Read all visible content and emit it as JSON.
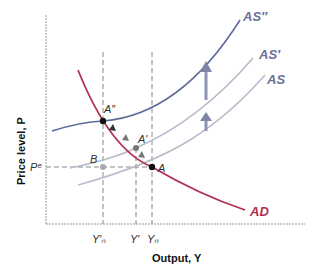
{
  "diagram": {
    "x_axis_title": "Output, Y",
    "y_axis_title": "Price level, P",
    "y_tick": "Pᵉ",
    "x_ticks": [
      "Y′ₙ",
      "Y′",
      "Yₙ"
    ],
    "curves": {
      "AD": {
        "label": "AD",
        "color": "#b03050"
      },
      "AS": {
        "label": "AS",
        "color": "#b8bccb"
      },
      "AS_prime": {
        "label": "AS′",
        "color": "#b8bccb"
      },
      "AS_double": {
        "label": "AS″",
        "color": "#5e6b9a"
      }
    },
    "points": {
      "A": "A",
      "A_prime": "A′",
      "A_double": "A″",
      "B": "B"
    },
    "colors": {
      "axis": "#9a9a9a",
      "guide": "#888888",
      "arrow": "#8c93b4",
      "label_as": "#6a7199",
      "label_ad": "#b03050"
    }
  }
}
